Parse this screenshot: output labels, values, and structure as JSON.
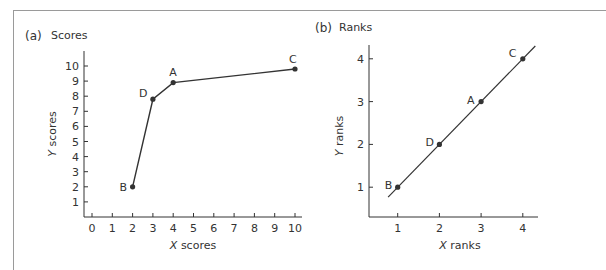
{
  "chart_data": [
    {
      "type": "line",
      "panel_label": "(a)",
      "title": "Scores",
      "xlabel": "X scores",
      "ylabel": "Y scores",
      "xticks": [
        0,
        1,
        2,
        3,
        4,
        5,
        6,
        7,
        8,
        9,
        10
      ],
      "yticks": [
        1,
        2,
        3,
        4,
        5,
        6,
        7,
        8,
        9,
        10
      ],
      "xlim": [
        -0.4,
        10.3
      ],
      "ylim": [
        0,
        11
      ],
      "grid": false,
      "points": [
        {
          "label": "B",
          "x": 2,
          "y": 2
        },
        {
          "label": "D",
          "x": 3,
          "y": 7.8
        },
        {
          "label": "A",
          "x": 4,
          "y": 8.9
        },
        {
          "label": "C",
          "x": 10,
          "y": 9.8
        }
      ]
    },
    {
      "type": "line",
      "panel_label": "(b)",
      "title": "Ranks",
      "xlabel": "X ranks",
      "ylabel": "Y ranks",
      "xticks": [
        1,
        2,
        3,
        4
      ],
      "yticks": [
        1,
        2,
        3,
        4
      ],
      "xlim": [
        0.3,
        4.4
      ],
      "ylim": [
        0.3,
        4.3
      ],
      "grid": false,
      "points": [
        {
          "label": "B",
          "x": 1,
          "y": 1
        },
        {
          "label": "D",
          "x": 2,
          "y": 2
        },
        {
          "label": "A",
          "x": 3,
          "y": 3
        },
        {
          "label": "C",
          "x": 4,
          "y": 4
        }
      ],
      "fit_line": {
        "x_start": 0.77,
        "x_end": 4.3
      }
    }
  ],
  "colors": {
    "ink": "#333333",
    "frame": "#9a9a9a"
  }
}
